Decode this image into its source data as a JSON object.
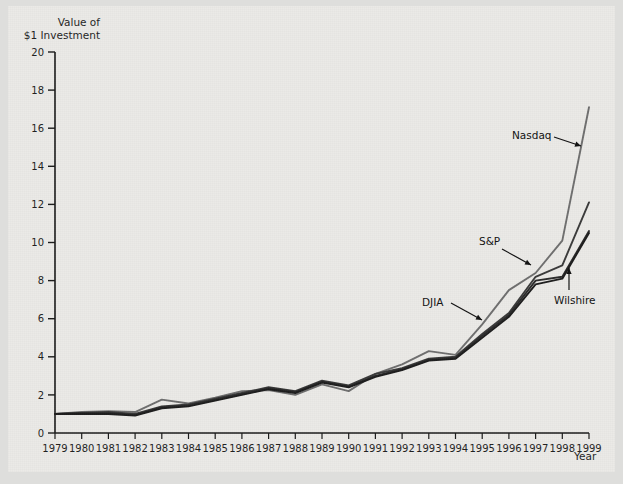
{
  "figure": {
    "background_color": "#ebeae7",
    "page_color": "#dededc",
    "axis_color": "#1a1a1a"
  },
  "axes": {
    "y_title_line1": "Value of",
    "y_title_line2": "$1 Investment",
    "x_title": "Year"
  },
  "annotations": [
    {
      "name": "nasdaq",
      "label": "Nasdaq"
    },
    {
      "name": "sp",
      "label": "S&P"
    },
    {
      "name": "djia",
      "label": "DJIA"
    },
    {
      "name": "wilshire",
      "label": "Wilshire"
    }
  ],
  "chart_data": {
    "type": "line",
    "title": "",
    "subtitle": "",
    "xlabel": "Year",
    "ylabel": "Value of $1 Investment",
    "xlim": [
      1979,
      1999
    ],
    "ylim": [
      0,
      20
    ],
    "yticks": [
      0,
      2,
      4,
      6,
      8,
      10,
      12,
      14,
      16,
      18,
      20
    ],
    "grid": false,
    "legend_position": "inline-annotations",
    "categories": [
      1979,
      1980,
      1981,
      1982,
      1983,
      1984,
      1985,
      1986,
      1987,
      1988,
      1989,
      1990,
      1991,
      1992,
      1993,
      1994,
      1995,
      1996,
      1997,
      1998,
      1999
    ],
    "x": [
      1979,
      1980,
      1981,
      1982,
      1983,
      1984,
      1985,
      1986,
      1987,
      1988,
      1989,
      1990,
      1991,
      1992,
      1993,
      1994,
      1995,
      1996,
      1997,
      1998,
      1999
    ],
    "series": [
      {
        "name": "Nasdaq",
        "color": "#6e6e6e",
        "values": [
          1.0,
          1.1,
          1.15,
          1.1,
          1.75,
          1.55,
          1.85,
          2.2,
          2.25,
          2.0,
          2.55,
          2.2,
          3.1,
          3.6,
          4.3,
          4.1,
          5.7,
          7.5,
          8.4,
          10.1,
          17.1
        ]
      },
      {
        "name": "S&P",
        "color": "#3a3a3a",
        "values": [
          1.0,
          1.05,
          1.1,
          1.0,
          1.4,
          1.5,
          1.8,
          2.1,
          2.4,
          2.2,
          2.75,
          2.5,
          3.1,
          3.4,
          3.9,
          4.0,
          5.2,
          6.3,
          8.2,
          8.8,
          12.1
        ]
      },
      {
        "name": "DJIA",
        "color": "#2b2b2b",
        "values": [
          1.0,
          1.05,
          1.05,
          0.95,
          1.35,
          1.45,
          1.75,
          2.05,
          2.35,
          2.15,
          2.7,
          2.45,
          3.0,
          3.35,
          3.85,
          3.95,
          5.1,
          6.2,
          8.0,
          8.2,
          10.6
        ]
      },
      {
        "name": "Wilshire",
        "color": "#1c1c1c",
        "values": [
          1.0,
          1.0,
          1.0,
          0.92,
          1.3,
          1.4,
          1.7,
          2.0,
          2.3,
          2.1,
          2.65,
          2.4,
          2.95,
          3.3,
          3.8,
          3.9,
          5.0,
          6.1,
          7.8,
          8.1,
          10.5
        ]
      }
    ]
  }
}
